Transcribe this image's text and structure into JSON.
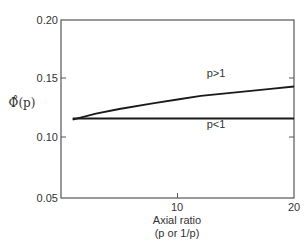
{
  "chart_data": {
    "type": "line",
    "title": "",
    "xlabel": "Axial ratio",
    "xlabel_sub": "(p or 1/p)",
    "ylabel": "Φ̊(p)",
    "xlim": [
      0,
      20
    ],
    "ylim": [
      0.05,
      0.2
    ],
    "xticks": [
      10,
      20
    ],
    "xtick_labels": [
      "10",
      "20"
    ],
    "yticks": [
      0.05,
      0.1,
      0.15,
      0.2
    ],
    "ytick_labels": [
      "0.05",
      "0.10",
      "0.15",
      "0.20"
    ],
    "grid": false,
    "legend": "none (inline labels)",
    "series": [
      {
        "name": "p > 1",
        "label": "p>1",
        "x": [
          1,
          3,
          5,
          8,
          10,
          12,
          15,
          18,
          20
        ],
        "y": [
          0.116,
          0.121,
          0.125,
          0.13,
          0.133,
          0.136,
          0.139,
          0.142,
          0.144
        ]
      },
      {
        "name": "p < 1",
        "label": "p<1",
        "x": [
          1,
          5,
          10,
          15,
          20
        ],
        "y": [
          0.117,
          0.117,
          0.117,
          0.117,
          0.117
        ]
      }
    ]
  }
}
